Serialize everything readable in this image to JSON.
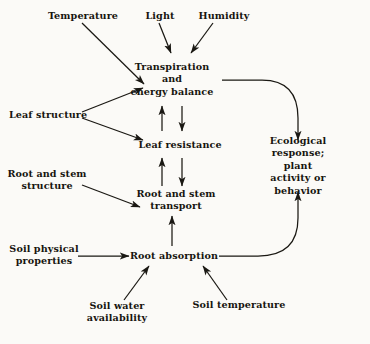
{
  "figure": {
    "background_color": "#fbfaf7",
    "ink_color": "#1a1813"
  },
  "nodes": {
    "temperature": "Temperature",
    "light": "Light",
    "humidity": "Humidity",
    "transpiration": "Transpiration\nand\nenergy balance",
    "leaf_structure": "Leaf structure",
    "leaf_resistance": "Leaf resistance",
    "root_stem_structure": "Root and stem\nstructure",
    "root_stem_transport": "Root and stem\ntransport",
    "soil_physical": "Soil physical\nproperties",
    "root_absorption": "Root absorption",
    "soil_water": "Soil water\navailability",
    "soil_temperature": "Soil temperature",
    "ecological_response": "Ecological response;\nplant activity or behavior"
  },
  "edges": [
    {
      "from": "temperature",
      "to": "transpiration",
      "style": "diagonal-arrow"
    },
    {
      "from": "light",
      "to": "transpiration",
      "style": "diagonal-arrow"
    },
    {
      "from": "humidity",
      "to": "transpiration",
      "style": "diagonal-arrow"
    },
    {
      "from": "leaf_structure",
      "to": "transpiration",
      "style": "diagonal-arrow"
    },
    {
      "from": "leaf_structure",
      "to": "leaf_resistance",
      "style": "diagonal-arrow"
    },
    {
      "from": "leaf_resistance",
      "to": "transpiration",
      "style": "vertical-arrow-up"
    },
    {
      "from": "transpiration",
      "to": "leaf_resistance",
      "style": "vertical-arrow-down"
    },
    {
      "from": "root_stem_transport",
      "to": "leaf_resistance",
      "style": "vertical-arrow-up"
    },
    {
      "from": "leaf_resistance",
      "to": "root_stem_transport",
      "style": "vertical-arrow-down"
    },
    {
      "from": "root_stem_structure",
      "to": "root_stem_transport",
      "style": "diagonal-arrow"
    },
    {
      "from": "root_absorption",
      "to": "root_stem_transport",
      "style": "vertical-arrow-up"
    },
    {
      "from": "soil_physical",
      "to": "root_absorption",
      "style": "horizontal-arrow"
    },
    {
      "from": "soil_water",
      "to": "root_absorption",
      "style": "diagonal-arrow"
    },
    {
      "from": "soil_temperature",
      "to": "root_absorption",
      "style": "diagonal-arrow"
    },
    {
      "from": "transpiration",
      "to": "ecological_response",
      "style": "curved-arrow-down"
    },
    {
      "from": "root_absorption",
      "to": "ecological_response",
      "style": "curved-arrow-up"
    }
  ]
}
